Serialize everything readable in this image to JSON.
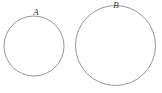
{
  "figure": {
    "background_color": "#ffffff",
    "stroke_color": "#8a8a8a",
    "label_color": "#3a3a3a",
    "shapes": [
      {
        "name": "circle-a",
        "label": "A",
        "cx": 34,
        "cy": 46,
        "r": 30,
        "label_x": 36,
        "label_y": 15
      },
      {
        "name": "circle-b",
        "label": "B",
        "cx": 115.5,
        "cy": 45.5,
        "r": 40,
        "label_x": 116,
        "label_y": 8
      }
    ]
  }
}
